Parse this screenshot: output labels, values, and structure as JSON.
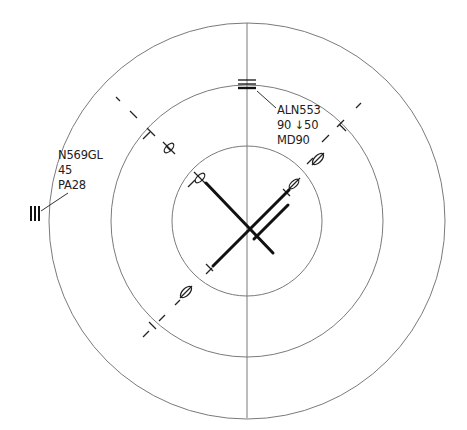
{
  "display": {
    "type": "traffic-display",
    "center": {
      "x": 247,
      "y": 221
    },
    "range_rings_radius_px": [
      75,
      136,
      198
    ],
    "colors": {
      "background": "#ffffff",
      "rings": "#777777",
      "lines": "#111111",
      "text": "#222222"
    }
  },
  "targets": [
    {
      "id": "target-aln553",
      "callsign": "ALN553",
      "altitude_line": "90 ↓50",
      "aircraft_type": "MD90",
      "symbol": "three-bar-horizontal"
    },
    {
      "id": "target-n569gl",
      "callsign": "N569GL",
      "altitude_line": "45",
      "aircraft_type": "PA28",
      "symbol": "three-bar-vertical"
    }
  ],
  "runways": [
    {
      "id": "runway-nw-se",
      "type": "single"
    },
    {
      "id": "runway-ne-sw",
      "type": "parallel-pair"
    }
  ]
}
